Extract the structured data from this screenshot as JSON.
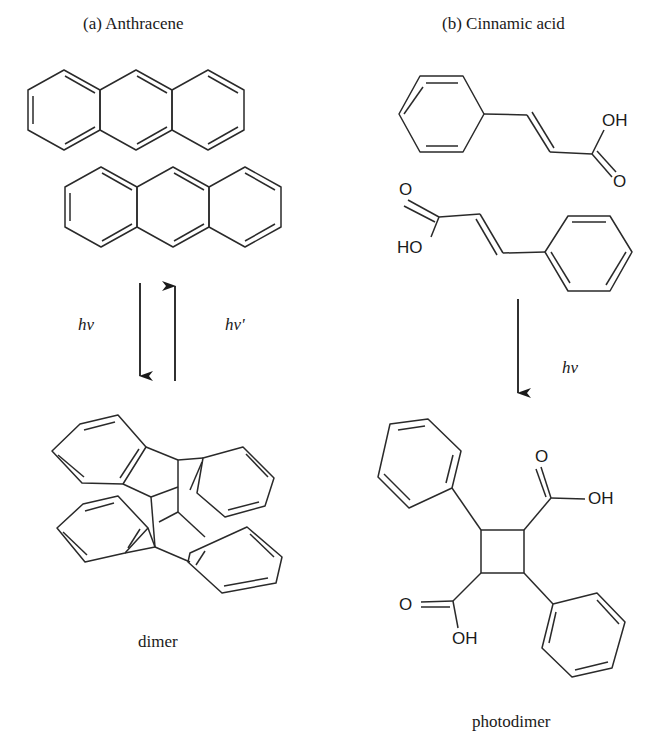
{
  "panels": {
    "a": {
      "title": "(a) Anthracene",
      "forward_label": "hv",
      "reverse_label": "hv'",
      "product_label": "dimer"
    },
    "b": {
      "title": "(b) Cinnamic acid",
      "forward_label": "hv",
      "product_label": "photodimer",
      "atoms": {
        "top_oh": "OH",
        "top_o": "O",
        "bottom_o": "O",
        "bottom_ho": "HO",
        "prod_o_top": "O",
        "prod_oh_top": "OH",
        "prod_o_bottom": "O",
        "prod_oh_bottom": "OH"
      }
    }
  },
  "colors": {
    "line": "#2a2a2a",
    "text": "#1a1a1a",
    "background": "#ffffff"
  }
}
